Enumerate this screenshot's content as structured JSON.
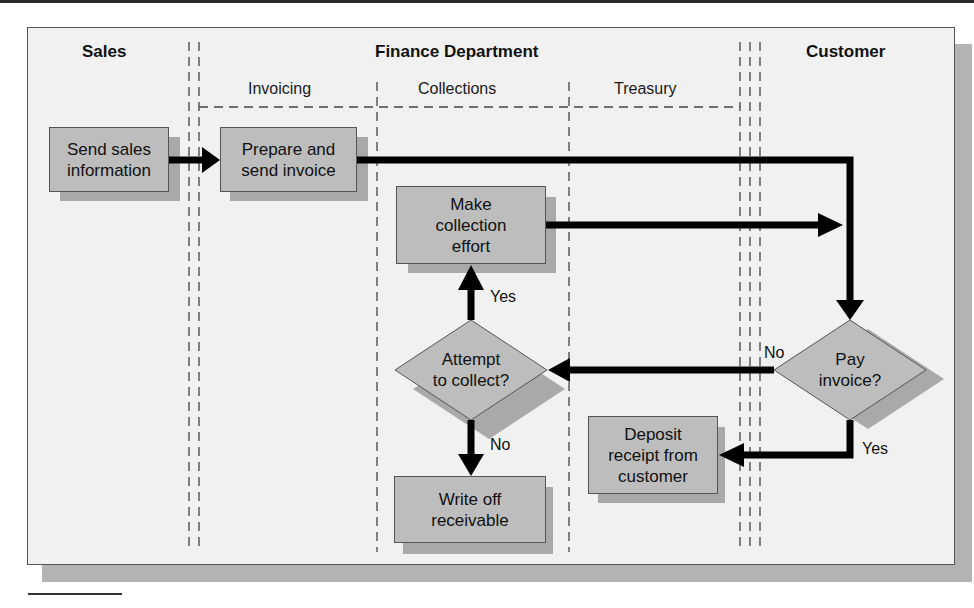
{
  "diagram": {
    "type": "swimlane-flowchart",
    "lanes": [
      {
        "name": "Sales"
      },
      {
        "name": "Finance Department",
        "sublanes": [
          "Invoicing",
          "Collections",
          "Treasury"
        ]
      },
      {
        "name": "Customer"
      }
    ],
    "nodes": {
      "send_sales": "Send sales\ninformation",
      "prepare_invoice": "Prepare and\nsend invoice",
      "make_collection": "Make\ncollection\neffort",
      "attempt_collect": "Attempt\nto collect?",
      "write_off": "Write off\nreceivable",
      "deposit_receipt": "Deposit\nreceipt from\ncustomer",
      "pay_invoice": "Pay\ninvoice?"
    },
    "edge_labels": {
      "attempt_yes": "Yes",
      "attempt_no": "No",
      "pay_no": "No",
      "pay_yes": "Yes"
    },
    "edges": [
      {
        "from": "send_sales",
        "to": "prepare_invoice"
      },
      {
        "from": "prepare_invoice",
        "to": "pay_invoice"
      },
      {
        "from": "make_collection",
        "to": "pay_invoice"
      },
      {
        "from": "pay_invoice",
        "to": "attempt_collect",
        "label": "No"
      },
      {
        "from": "pay_invoice",
        "to": "deposit_receipt",
        "label": "Yes"
      },
      {
        "from": "attempt_collect",
        "to": "make_collection",
        "label": "Yes"
      },
      {
        "from": "attempt_collect",
        "to": "write_off",
        "label": "No"
      }
    ],
    "colors": {
      "canvas": "#f1f1f1",
      "node_fill": "#bdbdbd",
      "node_shadow": "#a9a9a9",
      "frame_shadow": "#b3b3b3",
      "arrow": "#000000"
    }
  }
}
